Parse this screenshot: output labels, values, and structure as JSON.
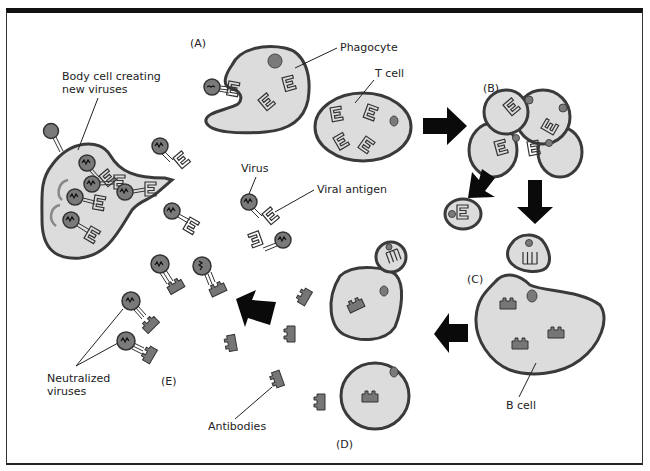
{
  "diagram": {
    "labels": {
      "body_cell": [
        "Body cell creating",
        "new viruses"
      ],
      "phagocyte": "Phagocyte",
      "t_cell": "T cell",
      "virus": "Virus",
      "viral_antigen": "Viral antigen",
      "b_cell": "B cell",
      "antibodies": "Antibodies",
      "neutralized": [
        "Neutralized",
        "viruses"
      ]
    },
    "stages": {
      "a": "(A)",
      "b": "(B)",
      "c": "(C)",
      "d": "(D)",
      "e": "(E)"
    },
    "colors": {
      "cell_fill": "#dcdcdc",
      "outline": "#3a3a3a",
      "nucleus": "#7a7a7a",
      "arrow": "#0a0a0a",
      "border": "#111111"
    }
  }
}
